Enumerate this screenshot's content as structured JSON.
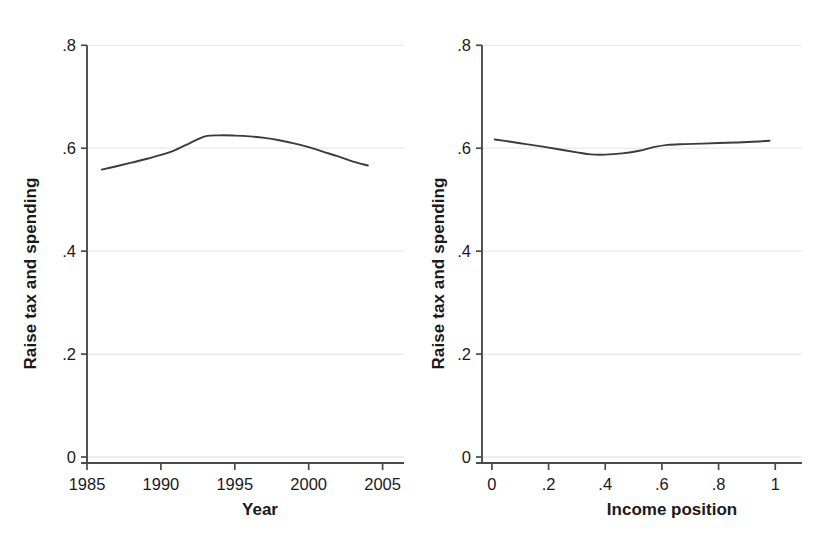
{
  "figure": {
    "background_color": "#ffffff",
    "line_color": "#3b3b3b",
    "axis_color": "#4a4a4a",
    "grid_color": "#e9e9e9"
  },
  "chart_data": [
    {
      "type": "line",
      "panel": "left",
      "title": "",
      "xlabel": "Year",
      "ylabel": "Raise tax and spending",
      "xlim": [
        1985,
        2005.5
      ],
      "ylim": [
        0,
        0.82
      ],
      "xticks": [
        1985,
        1990,
        1995,
        2000,
        2005
      ],
      "xticklabels": [
        "1985",
        "1990",
        "1995",
        "2000",
        "2005"
      ],
      "yticks": [
        0,
        0.2,
        0.4,
        0.6,
        0.8
      ],
      "yticklabels": [
        "0",
        ".2",
        ".4",
        ".6",
        ".8"
      ],
      "grid": "horizontal",
      "legend": "none",
      "series": [
        {
          "name": "Raise tax and spending",
          "x": [
            1986.0,
            1987.0,
            1988.0,
            1989.0,
            1990.0,
            1991.0,
            1992.0,
            1993.0,
            1994.0,
            1995.0,
            1996.0,
            1997.0,
            1998.0,
            1999.0,
            2000.0,
            2001.0,
            2002.0,
            2003.0,
            2004.0
          ],
          "y": [
            0.5585,
            0.565,
            0.572,
            0.579,
            0.587,
            0.597,
            0.6105,
            0.623,
            0.625,
            0.6245,
            0.623,
            0.62,
            0.6155,
            0.6095,
            0.602,
            0.593,
            0.584,
            0.574,
            0.5665
          ]
        }
      ]
    },
    {
      "type": "line",
      "panel": "right",
      "title": "",
      "xlabel": "Income position",
      "ylabel": "Raise tax and spending",
      "xlim": [
        -0.035,
        1.045
      ],
      "ylim": [
        0,
        0.82
      ],
      "xticks": [
        0,
        0.2,
        0.4,
        0.6,
        0.8,
        1
      ],
      "xticklabels": [
        "0",
        ".2",
        ".4",
        ".6",
        ".8",
        "1"
      ],
      "yticks": [
        0,
        0.2,
        0.4,
        0.6,
        0.8
      ],
      "yticklabels": [
        "0",
        ".2",
        ".4",
        ".6",
        ".8"
      ],
      "grid": "horizontal",
      "legend": "none",
      "series": [
        {
          "name": "Raise tax and spending",
          "x": [
            0.01,
            0.06,
            0.12,
            0.18,
            0.24,
            0.3,
            0.35,
            0.4,
            0.46,
            0.52,
            0.57,
            0.62,
            0.68,
            0.74,
            0.8,
            0.86,
            0.92,
            0.98
          ],
          "y": [
            0.617,
            0.613,
            0.608,
            0.603,
            0.5975,
            0.592,
            0.588,
            0.5875,
            0.59,
            0.595,
            0.602,
            0.6065,
            0.608,
            0.609,
            0.61,
            0.611,
            0.6125,
            0.6145
          ]
        }
      ]
    }
  ]
}
